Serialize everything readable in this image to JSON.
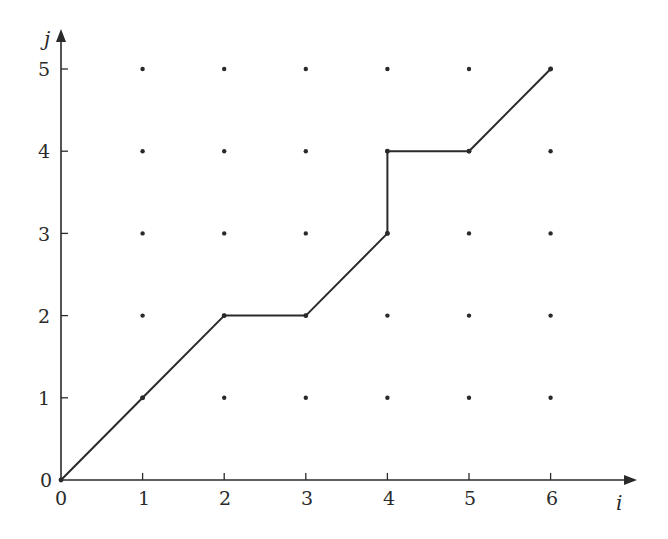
{
  "chart_data": {
    "type": "line",
    "title": "",
    "xlabel": "i",
    "ylabel": "j",
    "xlim": [
      0,
      6
    ],
    "ylim": [
      0,
      5
    ],
    "grid": false,
    "x_ticks": [
      "0",
      "1",
      "2",
      "3",
      "4",
      "5",
      "6"
    ],
    "y_ticks": [
      "0",
      "1",
      "2",
      "3",
      "4",
      "5"
    ],
    "lattice_points": "all integer points (i, j) with 1<=i<=6 and 1<=j<=5 shown as dots",
    "series": [
      {
        "name": "path",
        "points": [
          [
            0,
            0
          ],
          [
            1,
            1
          ],
          [
            2,
            2
          ],
          [
            3,
            2
          ],
          [
            4,
            3
          ],
          [
            4,
            4
          ],
          [
            5,
            4
          ],
          [
            6,
            5
          ]
        ]
      }
    ],
    "legend": null
  },
  "axes": {
    "x_label": "i",
    "y_label": "j",
    "x_origin_label": "0",
    "y_origin_label": "0",
    "x_tick_labels": [
      "1",
      "2",
      "3",
      "4",
      "5",
      "6"
    ],
    "y_tick_labels": [
      "1",
      "2",
      "3",
      "4",
      "5"
    ]
  },
  "colors": {
    "ink": "#2a2a2a",
    "background": "#ffffff"
  }
}
